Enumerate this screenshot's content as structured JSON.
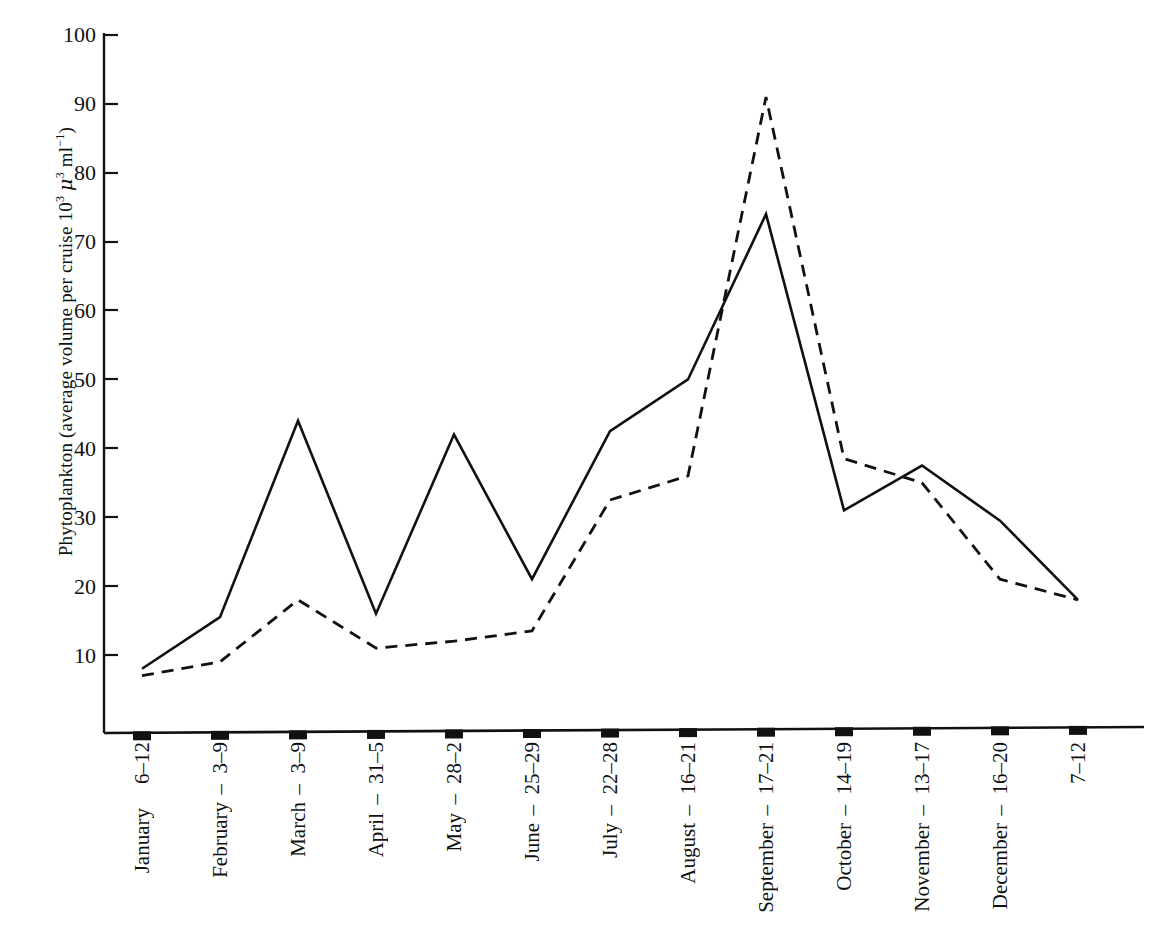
{
  "chart_data": {
    "type": "line",
    "title": "",
    "xlabel": "",
    "ylabel": "Phytoplankton (average volume per cruise 10³ μ³ ml⁻¹)",
    "ylim": [
      0,
      100
    ],
    "yticks": [
      10,
      20,
      30,
      40,
      50,
      60,
      70,
      80,
      90,
      100
    ],
    "grid": false,
    "legend": "none",
    "categories": [
      "6–12",
      "3–9",
      "3–9",
      "31–5",
      "28–2",
      "25–29",
      "22–28",
      "16–21",
      "17–21",
      "14–19",
      "13–17",
      "16–20",
      "7–12"
    ],
    "month_labels": [
      "January",
      "February",
      "March",
      "April",
      "May",
      "June",
      "July",
      "August",
      "September",
      "October",
      "November",
      "December"
    ],
    "series": [
      {
        "name": "solid",
        "style": "solid",
        "color": "#111111",
        "values": [
          8,
          15.5,
          44,
          16,
          42,
          21,
          42.5,
          50,
          74,
          31,
          37.5,
          29.5,
          18
        ]
      },
      {
        "name": "dashed",
        "style": "dashed",
        "color": "#111111",
        "values": [
          7,
          9,
          18,
          11,
          12,
          13.5,
          32.5,
          36,
          91,
          38.5,
          35,
          21,
          18
        ]
      }
    ]
  },
  "axis": {
    "y_title_main": "Phytoplankton (average volume per cruise 10",
    "y_title_exp1": "3",
    "y_title_mu": "μ",
    "y_title_exp2": "3",
    "y_title_unit": " ml",
    "y_title_exp3": "−1",
    "y_title_close": ")",
    "tick_10": "10",
    "tick_20": "20",
    "tick_30": "30",
    "tick_40": "40",
    "tick_50": "50",
    "tick_60": "60",
    "tick_70": "70",
    "tick_80": "80",
    "tick_90": "90",
    "tick_100": "100"
  },
  "xticks": [
    {
      "range": "6–12",
      "month": "January",
      "dash": ""
    },
    {
      "range": "3–9",
      "month": "",
      "dash": "–"
    },
    {
      "range": "3–9",
      "month": "February",
      "dash": ""
    },
    {
      "range": "31–5",
      "month": "",
      "dash": "–"
    },
    {
      "range": "28–2",
      "month": "March",
      "dash": ""
    },
    {
      "range": "25–29",
      "month": "",
      "dash": "–"
    },
    {
      "range": "22–28",
      "month": "April",
      "dash": ""
    },
    {
      "range": "16–21",
      "month": "",
      "dash": "–"
    },
    {
      "range": "17–21",
      "month": "May",
      "dash": ""
    },
    {
      "range": "14–19",
      "month": "",
      "dash": "–"
    },
    {
      "range": "13–17",
      "month": "June",
      "dash": ""
    },
    {
      "range": "16–20",
      "month": "",
      "dash": "–"
    },
    {
      "range": "7–12",
      "month": "July",
      "dash": ""
    }
  ],
  "xlabels_layout": [
    {
      "range": "6–12",
      "month": "January",
      "sep": ""
    },
    {
      "range": "3–9",
      "month": "February",
      "sep": "–"
    },
    {
      "range": "3–9",
      "month": "March",
      "sep": "–"
    },
    {
      "range": "31–5",
      "month": "April",
      "sep": "–"
    },
    {
      "range": "28–2",
      "month": "May",
      "sep": "–"
    },
    {
      "range": "25–29",
      "month": "June",
      "sep": "–"
    },
    {
      "range": "22–28",
      "month": "July",
      "sep": "–"
    },
    {
      "range": "16–21",
      "month": "August",
      "sep": "–"
    },
    {
      "range": "17–21",
      "month": "September",
      "sep": "–"
    },
    {
      "range": "14–19",
      "month": "October",
      "sep": "–"
    },
    {
      "range": "13–17",
      "month": "November",
      "sep": "–"
    },
    {
      "range": "16–20",
      "month": "December",
      "sep": "–"
    },
    {
      "range": "7–12",
      "month": "",
      "sep": ""
    }
  ]
}
